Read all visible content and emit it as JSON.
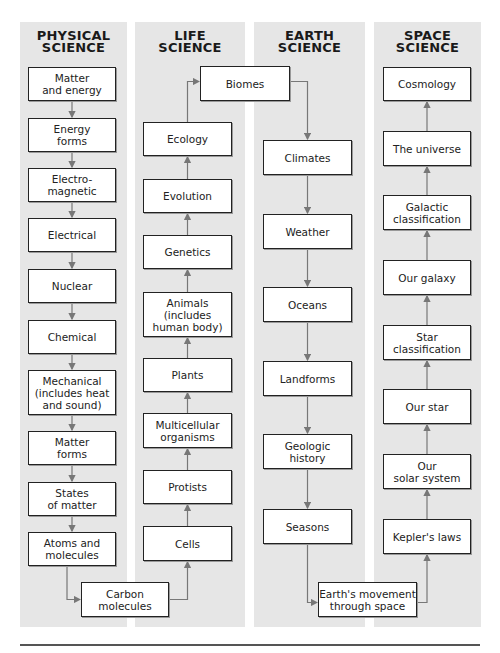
{
  "columns": [
    {
      "id": "physical",
      "title": "PHYSICAL\nSCIENCE",
      "topics": [
        "Matter\nand energy",
        "Energy\nforms",
        "Electro-\nmagnetic",
        "Electrical",
        "Nuclear",
        "Chemical",
        "Mechanical\n(includes heat\nand sound)",
        "Matter\nforms",
        "States\nof matter",
        "Atoms and\nmolecules"
      ]
    },
    {
      "id": "life",
      "title": "LIFE\nSCIENCE",
      "topics": [
        "Ecology",
        "Evolution",
        "Genetics",
        "Animals\n(includes\nhuman body)",
        "Plants",
        "Multicellular\norganisms",
        "Protists",
        "Cells"
      ]
    },
    {
      "id": "earth",
      "title": "EARTH\nSCIENCE",
      "topics": [
        "Climates",
        "Weather",
        "Oceans",
        "Landforms",
        "Geologic\nhistory",
        "Seasons"
      ]
    },
    {
      "id": "space",
      "title": "SPACE\nSCIENCE",
      "topics": [
        "Cosmology",
        "The universe",
        "Galactic\nclassification",
        "Our galaxy",
        "Star\nclassification",
        "Our star",
        "Our\nsolar system",
        "Kepler's laws"
      ]
    }
  ],
  "bridges": {
    "biomes": "Biomes",
    "carbon": "Carbon\nmolecules",
    "earth_movement": "Earth's movement\nthrough space"
  },
  "flow": {
    "physical": "top-to-bottom",
    "life": "bottom-to-top",
    "earth": "top-to-bottom",
    "space": "bottom-to-top"
  },
  "colors": {
    "panel": "#e6e6e6",
    "box_border": "#222222",
    "arrow": "#777777"
  }
}
